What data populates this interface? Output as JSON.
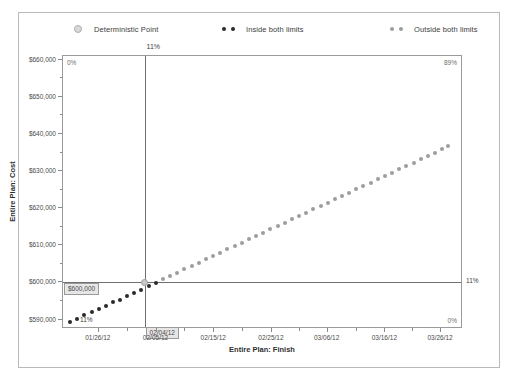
{
  "legend": {
    "items": [
      {
        "label": "Deterministic Point",
        "marker": "circle-outline",
        "color": "#d8d8d8"
      },
      {
        "label": "Inside both limits",
        "marker": "dotted",
        "color": "#2a2a2a"
      },
      {
        "label": "Outside both limits",
        "marker": "dotted",
        "color": "#9d9d9d"
      }
    ]
  },
  "annotations": {
    "top_percent": "11%",
    "top_left_percent": "0%",
    "top_right_percent": "89%",
    "bottom_left_percent": "11%",
    "bottom_right_percent": "0%",
    "right_percent": "11%",
    "cost_box": "$600,000",
    "date_box": "02/04/12"
  },
  "chart_data": {
    "type": "scatter",
    "title": "",
    "xlabel": "Entire Plan: Finish",
    "ylabel": "Entire Plan: Cost",
    "grid": false,
    "legend_position": "top",
    "xlim": [
      "01/21/12",
      "03/31/12"
    ],
    "ylim": [
      588000,
      661000
    ],
    "ytick_labels": [
      "$660,000",
      "$650,000",
      "$640,000",
      "$630,000",
      "$620,000",
      "$610,000",
      "$600,000",
      "$590,000"
    ],
    "ytick_values": [
      660000,
      650000,
      640000,
      630000,
      620000,
      610000,
      600000,
      590000
    ],
    "xtick_labels": [
      "01/26/12",
      "02/05/12",
      "02/15/12",
      "02/25/12",
      "03/06/12",
      "03/16/12",
      "03/26/12"
    ],
    "xtick_positions": [
      0.09,
      0.235,
      0.38,
      0.525,
      0.665,
      0.81,
      0.95
    ],
    "reference_lines": {
      "vertical_x": 0.205,
      "horizontal_y": 600000,
      "vertical_label": "02/04/12",
      "horizontal_label": "$600,000"
    },
    "deterministic_point": {
      "x": 0.205,
      "y": 600000
    },
    "series": [
      {
        "name": "Inside both limits",
        "color": "#2a2a2a",
        "points": [
          {
            "x": 0.018,
            "y": 589300
          },
          {
            "x": 0.036,
            "y": 590200
          },
          {
            "x": 0.054,
            "y": 591100
          },
          {
            "x": 0.072,
            "y": 592000
          },
          {
            "x": 0.09,
            "y": 592900
          },
          {
            "x": 0.108,
            "y": 593700
          },
          {
            "x": 0.126,
            "y": 594600
          },
          {
            "x": 0.143,
            "y": 595400
          },
          {
            "x": 0.161,
            "y": 596300
          },
          {
            "x": 0.179,
            "y": 597200
          },
          {
            "x": 0.197,
            "y": 598100
          },
          {
            "x": 0.215,
            "y": 599000
          },
          {
            "x": 0.233,
            "y": 599900
          }
        ]
      },
      {
        "name": "Outside both limits",
        "color": "#9d9d9d",
        "points": [
          {
            "x": 0.251,
            "y": 600800
          },
          {
            "x": 0.269,
            "y": 601700
          },
          {
            "x": 0.287,
            "y": 602600
          },
          {
            "x": 0.305,
            "y": 603500
          },
          {
            "x": 0.323,
            "y": 604400
          },
          {
            "x": 0.341,
            "y": 605300
          },
          {
            "x": 0.359,
            "y": 606200
          },
          {
            "x": 0.377,
            "y": 607100
          },
          {
            "x": 0.395,
            "y": 608000
          },
          {
            "x": 0.413,
            "y": 608900
          },
          {
            "x": 0.431,
            "y": 609800
          },
          {
            "x": 0.449,
            "y": 610700
          },
          {
            "x": 0.467,
            "y": 611600
          },
          {
            "x": 0.485,
            "y": 612500
          },
          {
            "x": 0.503,
            "y": 613400
          },
          {
            "x": 0.521,
            "y": 614300
          },
          {
            "x": 0.539,
            "y": 615200
          },
          {
            "x": 0.557,
            "y": 616100
          },
          {
            "x": 0.575,
            "y": 617000
          },
          {
            "x": 0.593,
            "y": 617900
          },
          {
            "x": 0.611,
            "y": 618800
          },
          {
            "x": 0.629,
            "y": 619700
          },
          {
            "x": 0.647,
            "y": 620600
          },
          {
            "x": 0.665,
            "y": 621500
          },
          {
            "x": 0.683,
            "y": 622400
          },
          {
            "x": 0.701,
            "y": 623300
          },
          {
            "x": 0.719,
            "y": 624200
          },
          {
            "x": 0.737,
            "y": 625100
          },
          {
            "x": 0.755,
            "y": 626000
          },
          {
            "x": 0.773,
            "y": 626900
          },
          {
            "x": 0.791,
            "y": 627800
          },
          {
            "x": 0.809,
            "y": 628700
          },
          {
            "x": 0.827,
            "y": 629600
          },
          {
            "x": 0.845,
            "y": 630500
          },
          {
            "x": 0.863,
            "y": 631400
          },
          {
            "x": 0.881,
            "y": 632300
          },
          {
            "x": 0.899,
            "y": 633200
          },
          {
            "x": 0.917,
            "y": 634100
          },
          {
            "x": 0.935,
            "y": 635000
          },
          {
            "x": 0.953,
            "y": 635900
          },
          {
            "x": 0.968,
            "y": 636700
          }
        ]
      }
    ]
  }
}
